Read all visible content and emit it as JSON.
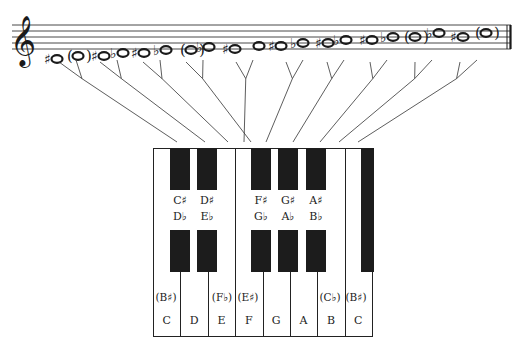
{
  "staff": {
    "clef": "treble-clef",
    "clef_glyph": "𝄞",
    "lines_y": [
      25,
      31,
      37,
      43,
      49
    ],
    "x_start": 12,
    "x_end": 511,
    "barline": "final-double-barline"
  },
  "notes": [
    {
      "acc": "♯",
      "paren": false,
      "x": 57,
      "y": 59,
      "target": "C#"
    },
    {
      "acc": "",
      "paren": true,
      "x": 78,
      "y": 56,
      "target": "D"
    },
    {
      "acc": "♯",
      "paren": false,
      "x": 104,
      "y": 56,
      "target": "D#"
    },
    {
      "acc": "♭",
      "paren": false,
      "x": 123,
      "y": 53,
      "target": "Eb"
    },
    {
      "acc": "♯",
      "paren": false,
      "x": 144,
      "y": 53,
      "target": "F#-enh"
    },
    {
      "acc": "♭",
      "paren": false,
      "x": 166,
      "y": 50,
      "target": "Fb/E"
    },
    {
      "acc": "",
      "paren": true,
      "x": 191,
      "y": 50,
      "target": "F"
    },
    {
      "acc": "♭",
      "paren": false,
      "x": 209,
      "y": 47,
      "target": "Gb"
    },
    {
      "acc": "♯",
      "paren": false,
      "x": 235,
      "y": 49,
      "target": "F#"
    },
    {
      "acc": "",
      "paren": false,
      "x": 259,
      "y": 46,
      "target": "G"
    },
    {
      "acc": "♯",
      "paren": false,
      "x": 281,
      "y": 46,
      "target": "G#"
    },
    {
      "acc": "♭",
      "paren": false,
      "x": 303,
      "y": 43,
      "target": "Ab"
    },
    {
      "acc": "♯",
      "paren": false,
      "x": 328,
      "y": 43,
      "target": "A#"
    },
    {
      "acc": "♭",
      "paren": false,
      "x": 346,
      "y": 40,
      "target": "Bb"
    },
    {
      "acc": "♯",
      "paren": false,
      "x": 372,
      "y": 40,
      "target": "B#"
    },
    {
      "acc": "♭",
      "paren": false,
      "x": 393,
      "y": 37,
      "target": "Cb"
    },
    {
      "acc": "",
      "paren": true,
      "x": 415,
      "y": 37,
      "target": "C"
    },
    {
      "acc": "♭",
      "paren": false,
      "x": 439,
      "y": 33,
      "target": "Db"
    },
    {
      "acc": "♯",
      "paren": false,
      "x": 463,
      "y": 37,
      "target": "C#"
    },
    {
      "acc": "",
      "paren": true,
      "x": 486,
      "y": 33,
      "target": "D"
    }
  ],
  "connectors": [
    {
      "from": [
        69,
        70
      ],
      "to": [
        177,
        142
      ]
    },
    {
      "from": [
        110,
        70
      ],
      "to": [
        205,
        142
      ]
    },
    {
      "from": [
        153,
        70
      ],
      "to": [
        228,
        142
      ]
    },
    {
      "from": [
        196,
        70
      ],
      "to": [
        251,
        142
      ]
    },
    {
      "from": [
        246,
        70
      ],
      "to": [
        244,
        142
      ]
    },
    {
      "from": [
        296,
        70
      ],
      "to": [
        266,
        142
      ]
    },
    {
      "from": [
        337,
        70
      ],
      "to": [
        293,
        142
      ]
    },
    {
      "from": [
        380,
        70
      ],
      "to": [
        320,
        142
      ]
    },
    {
      "from": [
        425,
        70
      ],
      "to": [
        339,
        142
      ]
    },
    {
      "from": [
        470,
        70
      ],
      "to": [
        358,
        142
      ]
    }
  ],
  "keyboard": {
    "x": 153,
    "y": 148,
    "width": 219,
    "height": 189,
    "white_keys": [
      "C",
      "D",
      "E",
      "F",
      "G",
      "A",
      "B",
      "C"
    ],
    "black_keys": [
      {
        "top": "C♯",
        "bottom": "D♭",
        "x": 170
      },
      {
        "top": "D♯",
        "bottom": "E♭",
        "x": 197
      },
      {
        "top": "F♯",
        "bottom": "G♭",
        "x": 251
      },
      {
        "top": "G♯",
        "bottom": "A♭",
        "x": 278
      },
      {
        "top": "A♯",
        "bottom": "B♭",
        "x": 306
      },
      {
        "top": "",
        "bottom": "",
        "x": 361
      }
    ],
    "enharmonic_labels": [
      {
        "text": "(B♯)",
        "x": 166,
        "y": 298
      },
      {
        "text": "(F♭)",
        "x": 222,
        "y": 298
      },
      {
        "text": "(E♯)",
        "x": 248,
        "y": 298
      },
      {
        "text": "(C♭)",
        "x": 330,
        "y": 298
      },
      {
        "text": "(B♯)",
        "x": 356,
        "y": 298
      }
    ]
  }
}
